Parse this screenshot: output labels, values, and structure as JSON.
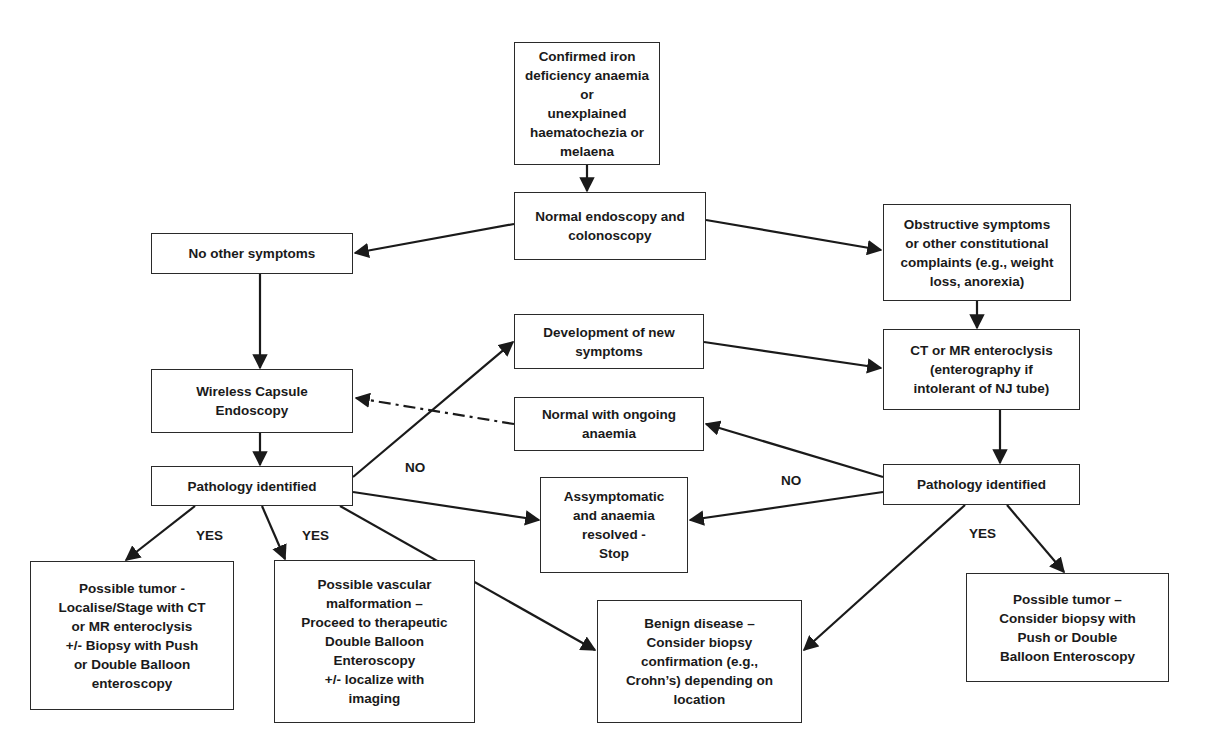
{
  "diagram": {
    "type": "flowchart",
    "nodes": {
      "start": "Confirmed iron\ndeficiency anaemia or\nunexplained\nhaematochezia or\nmelaena",
      "normal_endoscopy": "Normal endoscopy and\ncolonoscopy",
      "no_other_symptoms": "No other symptoms",
      "obstructive": "Obstructive symptoms\nor other constitutional\ncomplaints (e.g., weight\nloss, anorexia)",
      "new_symptoms": "Development of new\nsymptoms",
      "capsule": "Wireless Capsule\nEndoscopy",
      "ct_mr": "CT or MR enteroclysis\n(enterography if\nintolerant of NJ tube)",
      "normal_ongoing": "Normal with ongoing\nanaemia",
      "pathology_left": "Pathology identified",
      "pathology_right": "Pathology identified",
      "asymptomatic": "Assymptomatic\nand anaemia\nresolved -\nStop",
      "tumor_left": "Possible tumor -\nLocalise/Stage with CT\nor MR enteroclysis\n+/- Biopsy with Push\nor Double Balloon\nenteroscopy",
      "vascular": "Possible vascular\nmalformation –\nProceed to therapeutic\nDouble Balloon\nEnteroscopy\n+/- localize with\nimaging",
      "benign": "Benign disease –\nConsider biopsy\nconfirmation (e.g.,\nCrohn’s) depending on\nlocation",
      "tumor_right": "Possible tumor –\nConsider biopsy with\nPush or Double\nBalloon Enteroscopy"
    },
    "edge_labels": {
      "no_left": "NO",
      "no_right": "NO",
      "yes_left_1": "YES",
      "yes_left_2": "YES",
      "yes_right": "YES"
    },
    "edges": [
      {
        "from": "start",
        "to": "normal_endoscopy",
        "style": "solid"
      },
      {
        "from": "normal_endoscopy",
        "to": "no_other_symptoms",
        "style": "solid"
      },
      {
        "from": "normal_endoscopy",
        "to": "obstructive",
        "style": "solid"
      },
      {
        "from": "no_other_symptoms",
        "to": "capsule",
        "style": "solid"
      },
      {
        "from": "obstructive",
        "to": "ct_mr",
        "style": "solid"
      },
      {
        "from": "capsule",
        "to": "pathology_left",
        "style": "solid"
      },
      {
        "from": "pathology_left",
        "to": "new_symptoms",
        "style": "solid",
        "label": "NO"
      },
      {
        "from": "new_symptoms",
        "to": "ct_mr",
        "style": "solid"
      },
      {
        "from": "normal_ongoing",
        "to": "capsule",
        "style": "dash-dot"
      },
      {
        "from": "ct_mr",
        "to": "pathology_right",
        "style": "solid"
      },
      {
        "from": "pathology_right",
        "to": "normal_ongoing",
        "style": "solid",
        "label": "NO"
      },
      {
        "from": "pathology_left",
        "to": "asymptomatic",
        "style": "solid"
      },
      {
        "from": "pathology_right",
        "to": "asymptomatic",
        "style": "solid"
      },
      {
        "from": "pathology_left",
        "to": "tumor_left",
        "style": "solid",
        "label": "YES"
      },
      {
        "from": "pathology_left",
        "to": "vascular",
        "style": "solid",
        "label": "YES"
      },
      {
        "from": "pathology_left",
        "to": "benign",
        "style": "solid"
      },
      {
        "from": "pathology_right",
        "to": "benign",
        "style": "solid",
        "label": "YES"
      },
      {
        "from": "pathology_right",
        "to": "tumor_right",
        "style": "solid",
        "label": "YES"
      }
    ],
    "colors": {
      "line": "#1a1a1a",
      "box_border": "#2a2a2a",
      "background": "#ffffff",
      "text": "#1a1a1a"
    }
  }
}
